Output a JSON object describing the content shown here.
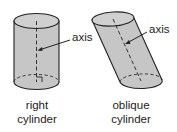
{
  "figures": [
    {
      "name": "right cylinder",
      "axis_label": "axis",
      "caption_line1": "right",
      "caption_line2": "cylinder"
    },
    {
      "name": "oblique cylinder",
      "axis_label": "axis",
      "caption_line1": "oblique",
      "caption_line2": "cylinder"
    }
  ],
  "colors": {
    "fill": "#c8c8c8",
    "top": "#d2d2d2",
    "stroke": "#222222"
  }
}
